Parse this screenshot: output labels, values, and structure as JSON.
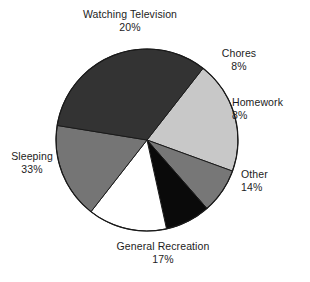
{
  "chart_data": {
    "type": "pie",
    "title": "",
    "subtitle": "",
    "xlabel": "",
    "ylabel": "",
    "legend_position": "none",
    "grid": false,
    "labels_show_percent": true,
    "total_percent": 100,
    "center": {
      "x": 147,
      "y": 140,
      "radius": 91
    },
    "start_angle_deg": -52,
    "direction": "clockwise",
    "categories": [
      "Watching Television",
      "Chores",
      "Homework",
      "Other",
      "General Recreation",
      "Sleeping"
    ],
    "values": [
      20,
      8,
      8,
      14,
      17,
      33
    ],
    "slices": [
      {
        "id": "watching-television",
        "label": "Watching Television",
        "value": 20,
        "percent_text": "20%",
        "color": "#c8c8c8",
        "stroke": "#1a1a1a"
      },
      {
        "id": "chores",
        "label": "Chores",
        "value": 8,
        "percent_text": "8%",
        "color": "#777777",
        "stroke": "#1a1a1a"
      },
      {
        "id": "homework",
        "label": "Homework",
        "value": 8,
        "percent_text": "8%",
        "color": "#0a0a0a",
        "stroke": "#1a1a1a"
      },
      {
        "id": "other",
        "label": "Other",
        "value": 14,
        "percent_text": "14%",
        "color": "#ffffff",
        "stroke": "#1a1a1a"
      },
      {
        "id": "general-recreation",
        "label": "General Recreation",
        "value": 17,
        "percent_text": "17%",
        "color": "#757575",
        "stroke": "#1a1a1a"
      },
      {
        "id": "sleeping",
        "label": "Sleeping",
        "value": 33,
        "percent_text": "33%",
        "color": "#333333",
        "stroke": "#1a1a1a"
      }
    ],
    "colors": {
      "background": "#ffffff",
      "outline": "#1a1a1a",
      "text": "#1c1c1c"
    }
  }
}
